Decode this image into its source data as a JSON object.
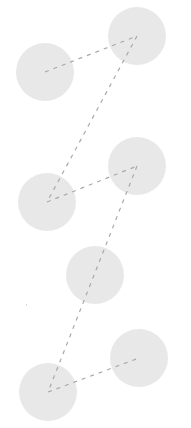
{
  "diagram": {
    "width": 191,
    "height": 428,
    "node_color": "#e8e8e8",
    "edge_color": "#a9a9a9",
    "node_radius": 29,
    "nodes": [
      {
        "id": "n1",
        "cx": 45,
        "cy": 72
      },
      {
        "id": "n2",
        "cx": 137,
        "cy": 36
      },
      {
        "id": "n3",
        "cx": 47,
        "cy": 202
      },
      {
        "id": "n4",
        "cx": 137,
        "cy": 166
      },
      {
        "id": "n5",
        "cx": 95,
        "cy": 275
      },
      {
        "id": "n6",
        "cx": 48,
        "cy": 392
      },
      {
        "id": "n7",
        "cx": 139,
        "cy": 358
      }
    ],
    "edges": [
      {
        "from": "n1",
        "to": "n2"
      },
      {
        "from": "n2",
        "to": "n3"
      },
      {
        "from": "n3",
        "to": "n4"
      },
      {
        "from": "n4",
        "to": "n6"
      },
      {
        "from": "n6",
        "to": "n7"
      }
    ],
    "stray_mark": {
      "x": 26,
      "y": 304
    }
  }
}
